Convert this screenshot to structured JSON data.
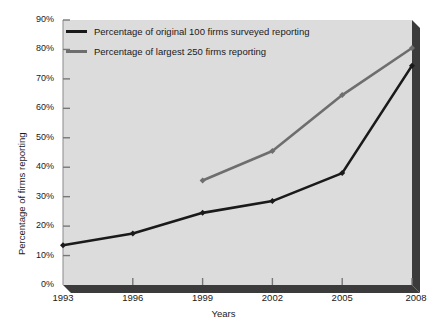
{
  "chart_data": {
    "type": "line",
    "title": "",
    "subtitle": "",
    "xlabel": "Years",
    "ylabel": "Percentage of firms reporting",
    "categories": [
      "1993",
      "1996",
      "1999",
      "2002",
      "2005",
      "2008"
    ],
    "x": [
      1993,
      1996,
      1999,
      2002,
      2005,
      2008
    ],
    "xlim": [
      1993,
      2008
    ],
    "ylim": [
      0,
      90
    ],
    "y_ticks": [
      "0%",
      "10%",
      "20%",
      "30%",
      "40%",
      "50%",
      "60%",
      "70%",
      "80%",
      "90%"
    ],
    "y_tick_values": [
      0,
      10,
      20,
      30,
      40,
      50,
      60,
      70,
      80,
      90
    ],
    "grid": false,
    "legend_position": "top-left-inside",
    "series": [
      {
        "name": "Percentage of original 100 firms surveyed reporting",
        "color": "#1a1a1a",
        "marker": "diamond",
        "x": [
          1993,
          1996,
          1999,
          2002,
          2005,
          2008
        ],
        "values": [
          13.5,
          17.5,
          24.5,
          28.5,
          38,
          74.5
        ]
      },
      {
        "name": "Percentage of largest 250 firms reporting",
        "color": "#6e6e6e",
        "marker": "diamond",
        "x": [
          1999,
          2002,
          2005,
          2008
        ],
        "values": [
          35.5,
          45.5,
          64.5,
          80.5
        ]
      }
    ],
    "plot_background": "#dcdcdc",
    "figure_background": "#ffffff",
    "shadow_color": "#3b3b3b"
  }
}
